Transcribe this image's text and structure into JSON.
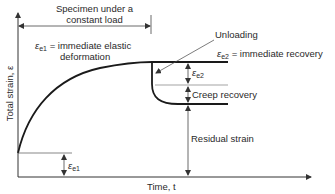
{
  "diagram": {
    "type": "creep-recovery strain-time diagram",
    "axes": {
      "y_label": "Total strain, ε",
      "x_label": "Time, t"
    },
    "annotations": {
      "load_span": "Specimen under a constant load",
      "load_span_line1": "Specimen under a",
      "load_span_line2": "constant load",
      "eps_e1_symbol": "ε",
      "eps_e1_sub": "e1",
      "eps_e1_def_line1": "= immediate elastic",
      "eps_e1_def_line2": "deformation",
      "unloading": "Unloading",
      "eps_e2_symbol": "ε",
      "eps_e2_sub": "e2",
      "eps_e2_def": "= immediate recovery",
      "creep_recovery": "Creep recovery",
      "residual_strain": "Residual strain"
    },
    "colors": {
      "line": "#1a1a1a",
      "thin_line": "#555555",
      "background": "#ffffff"
    }
  }
}
